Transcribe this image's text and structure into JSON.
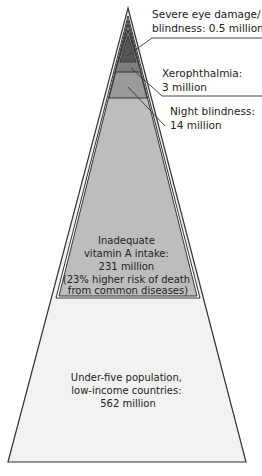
{
  "tiers": [
    {
      "id": "severe",
      "label_lines": [
        "Severe eye damage/",
        "blindness: 0.5 million"
      ],
      "value_million": 0.5,
      "color": "#555555"
    },
    {
      "id": "xerophthalmia",
      "label_lines": [
        "Xerophthalmia:",
        "3 million"
      ],
      "value_million": 3,
      "color": "#7d7d7d"
    },
    {
      "id": "night-blindness",
      "label_lines": [
        "Night blindness:",
        "14 million"
      ],
      "value_million": 14,
      "color": "#9a9a9a"
    },
    {
      "id": "inadequate-intake",
      "label_lines": [
        "Inadequate",
        "vitamin A intake:",
        "231 million",
        "(23% higher risk of death",
        "from common diseases)"
      ],
      "value_million": 231,
      "color": "#bdbdbd"
    },
    {
      "id": "under-five",
      "label_lines": [
        "Under-five population,",
        "low-income countries:",
        "562 million"
      ],
      "value_million": 562,
      "color": "#f2f2f2"
    }
  ],
  "colors": {
    "outline": "#333333",
    "outer_band": "#ffffff"
  }
}
